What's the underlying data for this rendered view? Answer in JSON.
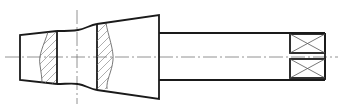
{
  "diagram": {
    "type": "mechanical-shaft-drawing",
    "colors": {
      "outline": "#1a1a1a",
      "thin_line": "#555555",
      "center_line": "#777777",
      "background": "#ffffff"
    },
    "centerlines": {
      "horizontal": {
        "x1": 5,
        "x2": 338,
        "y": 57
      },
      "vertical": {
        "x": 77,
        "y1": 10,
        "y2": 104
      }
    },
    "parts": [
      {
        "name": "left-taper",
        "points": "20,35 57,31 57,84 20,80"
      },
      {
        "name": "neck",
        "x1": 57,
        "x2": 97
      },
      {
        "name": "large-cone",
        "points": "97,24 159,15 159,99 97,90"
      },
      {
        "name": "shaft",
        "x1": 159,
        "x2": 325,
        "top": 33,
        "bottom": 80
      }
    ],
    "sections": [
      {
        "name": "section-left",
        "x": 57
      },
      {
        "name": "section-right",
        "x": 97
      }
    ],
    "boxes": [
      {
        "name": "upper-box",
        "x": 290,
        "y": 34,
        "w": 35,
        "h": 19
      },
      {
        "name": "lower-box",
        "x": 290,
        "y": 59,
        "w": 35,
        "h": 19
      }
    ]
  }
}
